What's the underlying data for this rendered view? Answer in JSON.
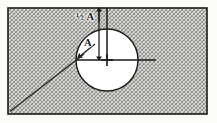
{
  "figure": {
    "kind": "engineering-drawing",
    "labels": {
      "half_a": "½ A",
      "a": "A"
    },
    "colors": {
      "ink": "#1a1a1a",
      "hatch": "#8a8a88",
      "paper": "#fbfbfa",
      "hole_fill": "#ffffff"
    },
    "geometry": {
      "plate": {
        "x": 8,
        "y": 8,
        "width": 199,
        "height": 106
      },
      "hole": {
        "cx": 107,
        "cy": 60,
        "r": 31
      },
      "centerline_horizontal": {
        "x1": 76,
        "x2": 156,
        "y": 60
      },
      "centerline_vertical": {
        "x": 107,
        "y1": 8,
        "y2": 60
      },
      "dimension_half_a": {
        "x": 99,
        "from_y": 9,
        "to_y": 60
      },
      "radius_arrow": {
        "x1": 94,
        "y1": 45,
        "x2": 79,
        "y2": 57
      },
      "diagonal": {
        "x1": 10,
        "y1": 111,
        "x2": 83,
        "y2": 55
      }
    }
  }
}
